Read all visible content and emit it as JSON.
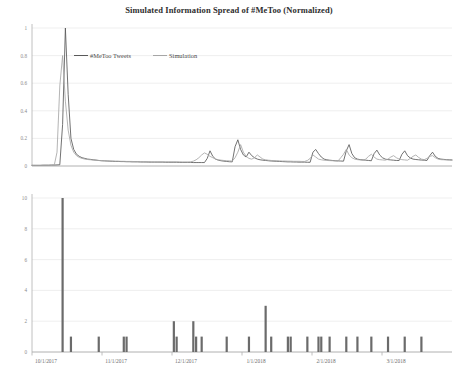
{
  "chart_data": [
    {
      "type": "line",
      "title": "Simulated Information Spread of #MeToo (Normalized)",
      "xlabel": "",
      "ylabel": "",
      "ylim": [
        0,
        1
      ],
      "yticks": [
        "0",
        "0.2",
        "0.4",
        "0.6",
        "0.8",
        "1"
      ],
      "ytick_values": [
        0,
        0.2,
        0.4,
        0.6,
        0.8,
        1
      ],
      "xticks": [
        "10/1/2017",
        "11/1/2017",
        "12/1/2017",
        "1/1/2018",
        "2/1/2018",
        "3/1/2018"
      ],
      "grid": true,
      "legend_position": "top-left-inside",
      "series": [
        {
          "name": "#MeToo Tweets",
          "color": "#595959",
          "x": [
            0,
            1,
            2,
            3,
            4,
            5,
            6,
            7,
            8,
            9,
            10,
            11,
            12,
            13,
            14,
            15,
            16,
            17,
            18,
            19,
            20,
            21,
            22,
            23,
            24,
            25,
            26,
            27,
            28,
            29,
            30,
            31,
            32,
            33,
            34,
            35,
            36,
            37,
            38,
            39,
            40,
            41,
            42,
            43,
            44,
            45,
            46,
            47,
            48,
            49,
            50,
            51,
            52,
            53,
            54,
            55,
            56,
            57,
            58,
            59,
            60,
            61,
            62,
            63,
            64,
            65,
            66,
            67,
            68,
            69,
            70,
            71,
            72,
            73,
            74,
            75,
            76,
            77,
            78,
            79,
            80,
            81,
            82,
            83,
            84,
            85,
            86,
            87,
            88,
            89,
            90,
            91,
            92,
            93,
            94,
            95,
            96,
            97,
            98,
            99,
            100,
            101,
            102,
            103,
            104,
            105,
            106,
            107,
            108,
            109,
            110,
            111,
            112,
            113,
            114,
            115,
            116,
            117,
            118,
            119,
            120,
            121,
            122,
            123,
            124,
            125,
            126,
            127,
            128,
            129,
            130,
            131,
            132,
            133,
            134,
            135,
            136,
            137,
            138,
            139,
            140,
            141,
            142,
            143,
            144,
            145,
            146,
            147,
            148,
            149,
            150,
            151
          ],
          "values": [
            0.005,
            0.005,
            0.005,
            0.005,
            0.006,
            0.006,
            0.006,
            0.007,
            0.007,
            0.008,
            0.009,
            0.3,
            1.0,
            0.52,
            0.2,
            0.12,
            0.085,
            0.07,
            0.06,
            0.055,
            0.05,
            0.048,
            0.045,
            0.043,
            0.04,
            0.038,
            0.037,
            0.036,
            0.035,
            0.034,
            0.033,
            0.033,
            0.032,
            0.032,
            0.031,
            0.031,
            0.03,
            0.03,
            0.03,
            0.029,
            0.029,
            0.029,
            0.028,
            0.028,
            0.028,
            0.028,
            0.028,
            0.028,
            0.027,
            0.027,
            0.027,
            0.027,
            0.027,
            0.026,
            0.026,
            0.026,
            0.026,
            0.026,
            0.025,
            0.025,
            0.025,
            0.025,
            0.025,
            0.055,
            0.11,
            0.07,
            0.05,
            0.042,
            0.038,
            0.035,
            0.033,
            0.031,
            0.03,
            0.14,
            0.19,
            0.12,
            0.08,
            0.065,
            0.1,
            0.075,
            0.06,
            0.05,
            0.045,
            0.042,
            0.04,
            0.038,
            0.036,
            0.035,
            0.034,
            0.033,
            0.032,
            0.031,
            0.03,
            0.03,
            0.029,
            0.029,
            0.028,
            0.028,
            0.028,
            0.027,
            0.027,
            0.1,
            0.12,
            0.09,
            0.065,
            0.05,
            0.045,
            0.042,
            0.04,
            0.038,
            0.037,
            0.036,
            0.035,
            0.11,
            0.155,
            0.09,
            0.06,
            0.05,
            0.046,
            0.044,
            0.042,
            0.04,
            0.038,
            0.09,
            0.115,
            0.08,
            0.06,
            0.05,
            0.046,
            0.044,
            0.042,
            0.04,
            0.04,
            0.085,
            0.11,
            0.075,
            0.058,
            0.05,
            0.047,
            0.045,
            0.043,
            0.042,
            0.04,
            0.075,
            0.1,
            0.07,
            0.055,
            0.05,
            0.048,
            0.046,
            0.045,
            0.044,
            0.043,
            0.042,
            0.04
          ]
        },
        {
          "name": "Simulation",
          "color": "#a6a6a6",
          "x": [
            0,
            1,
            2,
            3,
            4,
            5,
            6,
            7,
            8,
            9,
            10,
            11,
            12,
            13,
            14,
            15,
            16,
            17,
            18,
            19,
            20,
            21,
            22,
            23,
            24,
            25,
            26,
            27,
            28,
            29,
            30,
            31,
            32,
            33,
            34,
            35,
            36,
            37,
            38,
            39,
            40,
            41,
            42,
            43,
            44,
            45,
            46,
            47,
            48,
            49,
            50,
            51,
            52,
            53,
            54,
            55,
            56,
            57,
            58,
            59,
            60,
            61,
            62,
            63,
            64,
            65,
            66,
            67,
            68,
            69,
            70,
            71,
            72,
            73,
            74,
            75,
            76,
            77,
            78,
            79,
            80,
            81,
            82,
            83,
            84,
            85,
            86,
            87,
            88,
            89,
            90,
            91,
            92,
            93,
            94,
            95,
            96,
            97,
            98,
            99,
            100,
            101,
            102,
            103,
            104,
            105,
            106,
            107,
            108,
            109,
            110,
            111,
            112,
            113,
            114,
            115,
            116,
            117,
            118,
            119,
            120,
            121,
            122,
            123,
            124,
            125,
            126,
            127,
            128,
            129,
            130,
            131,
            132,
            133,
            134,
            135,
            136,
            137,
            138,
            139,
            140,
            141,
            142,
            143,
            144,
            145,
            146,
            147,
            148,
            149,
            150,
            151
          ],
          "values": [
            0.004,
            0.004,
            0.004,
            0.004,
            0.005,
            0.005,
            0.005,
            0.006,
            0.006,
            0.1,
            0.58,
            0.8,
            0.47,
            0.26,
            0.15,
            0.1,
            0.075,
            0.062,
            0.055,
            0.05,
            0.047,
            0.045,
            0.043,
            0.041,
            0.04,
            0.039,
            0.038,
            0.037,
            0.036,
            0.036,
            0.035,
            0.035,
            0.034,
            0.034,
            0.033,
            0.033,
            0.033,
            0.032,
            0.032,
            0.032,
            0.031,
            0.031,
            0.031,
            0.03,
            0.03,
            0.03,
            0.03,
            0.03,
            0.03,
            0.03,
            0.03,
            0.03,
            0.03,
            0.03,
            0.029,
            0.029,
            0.029,
            0.03,
            0.035,
            0.045,
            0.06,
            0.08,
            0.095,
            0.085,
            0.07,
            0.06,
            0.05,
            0.045,
            0.042,
            0.04,
            0.038,
            0.037,
            0.036,
            0.06,
            0.1,
            0.155,
            0.1,
            0.07,
            0.055,
            0.05,
            0.06,
            0.08,
            0.065,
            0.05,
            0.045,
            0.042,
            0.04,
            0.039,
            0.038,
            0.037,
            0.036,
            0.036,
            0.035,
            0.035,
            0.034,
            0.034,
            0.034,
            0.033,
            0.033,
            0.04,
            0.055,
            0.08,
            0.065,
            0.05,
            0.045,
            0.042,
            0.04,
            0.039,
            0.038,
            0.037,
            0.036,
            0.06,
            0.085,
            0.12,
            0.08,
            0.06,
            0.05,
            0.046,
            0.044,
            0.042,
            0.05,
            0.07,
            0.085,
            0.065,
            0.05,
            0.046,
            0.044,
            0.042,
            0.05,
            0.065,
            0.075,
            0.06,
            0.05,
            0.046,
            0.044,
            0.042,
            0.055,
            0.07,
            0.08,
            0.062,
            0.05,
            0.046,
            0.055,
            0.07,
            0.075,
            0.06,
            0.05,
            0.046,
            0.045,
            0.044,
            0.043,
            0.042
          ]
        }
      ]
    },
    {
      "type": "bar",
      "title": "",
      "xlabel": "",
      "ylabel": "",
      "ylim": [
        0,
        10
      ],
      "yticks": [
        "0",
        "2",
        "4",
        "6",
        "8",
        "10"
      ],
      "ytick_values": [
        0,
        2,
        4,
        6,
        8,
        10
      ],
      "xticks": [
        "10/1/2017",
        "11/1/2017",
        "12/1/2017",
        "1/1/2018",
        "2/1/2018",
        "3/1/2018"
      ],
      "grid": true,
      "legend_position": "top-left-inside",
      "series": [
        {
          "name": "Number of Related External Events",
          "color": "#6b6b6b",
          "bars": [
            {
              "x": 11,
              "value": 10
            },
            {
              "x": 14,
              "value": 1
            },
            {
              "x": 24,
              "value": 1
            },
            {
              "x": 33,
              "value": 1
            },
            {
              "x": 34,
              "value": 1
            },
            {
              "x": 51,
              "value": 2
            },
            {
              "x": 52,
              "value": 1
            },
            {
              "x": 58,
              "value": 2
            },
            {
              "x": 59,
              "value": 1
            },
            {
              "x": 61,
              "value": 1
            },
            {
              "x": 70,
              "value": 1
            },
            {
              "x": 78,
              "value": 1
            },
            {
              "x": 84,
              "value": 3
            },
            {
              "x": 86,
              "value": 1
            },
            {
              "x": 92,
              "value": 1
            },
            {
              "x": 93,
              "value": 1
            },
            {
              "x": 99,
              "value": 1
            },
            {
              "x": 103,
              "value": 1
            },
            {
              "x": 104,
              "value": 1
            },
            {
              "x": 107,
              "value": 1
            },
            {
              "x": 113,
              "value": 1
            },
            {
              "x": 117,
              "value": 1
            },
            {
              "x": 122,
              "value": 1
            },
            {
              "x": 128,
              "value": 1
            },
            {
              "x": 134,
              "value": 1
            },
            {
              "x": 140,
              "value": 1
            }
          ]
        }
      ]
    }
  ],
  "top_chart": {
    "title": "Simulated Information Spread of #MeToo (Normalized)",
    "legend": {
      "tweets_label": "#MeToo Tweets",
      "simulation_label": "Simulation"
    }
  },
  "bottom_chart": {
    "legend": {
      "events_label": "Number of Related External Events"
    }
  },
  "colors": {
    "tweets": "#595959",
    "simulation": "#a6a6a6",
    "events": "#6b6b6b",
    "grid": "#e8e8e8",
    "axis": "#b0b0b0",
    "text": "#3a3a3a"
  }
}
